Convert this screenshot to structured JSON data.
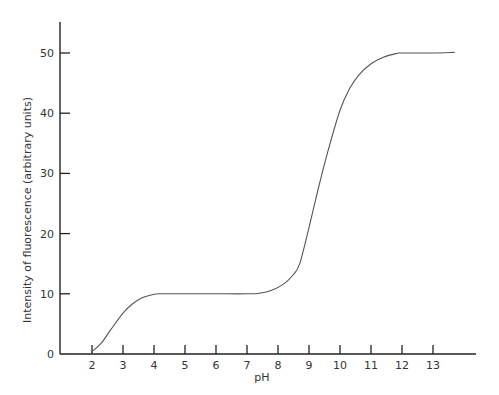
{
  "chart_data": {
    "type": "line",
    "title": "",
    "xlabel": "pH",
    "ylabel": "Intensity of fluorescence (arbitrary units)",
    "xlim": [
      1,
      14.3
    ],
    "ylim": [
      0,
      55
    ],
    "grid": false,
    "legend": null,
    "x_ticks": [
      2,
      3,
      4,
      5,
      6,
      7,
      8,
      9,
      10,
      11,
      12,
      13
    ],
    "y_ticks": [
      0,
      10,
      20,
      30,
      40,
      50
    ],
    "series": [
      {
        "name": "fluorescence",
        "x": [
          1.0,
          1.9,
          2.0,
          2.3,
          2.6,
          3.0,
          3.3,
          3.6,
          3.9,
          4.2,
          5.0,
          6.0,
          7.0,
          7.4,
          7.8,
          8.2,
          8.5,
          8.7,
          9.0,
          9.3,
          9.6,
          10.0,
          10.3,
          10.6,
          11.0,
          11.4,
          11.8,
          12.0,
          13.0,
          13.7
        ],
        "y": [
          0,
          0,
          0.4,
          1.8,
          4.0,
          6.8,
          8.3,
          9.3,
          9.8,
          10.0,
          10.0,
          10.0,
          10.0,
          10.1,
          10.6,
          11.7,
          13.2,
          15.0,
          21.0,
          27.5,
          33.5,
          40.5,
          44.0,
          46.3,
          48.2,
          49.3,
          49.9,
          50.0,
          50.0,
          50.1
        ]
      }
    ]
  }
}
